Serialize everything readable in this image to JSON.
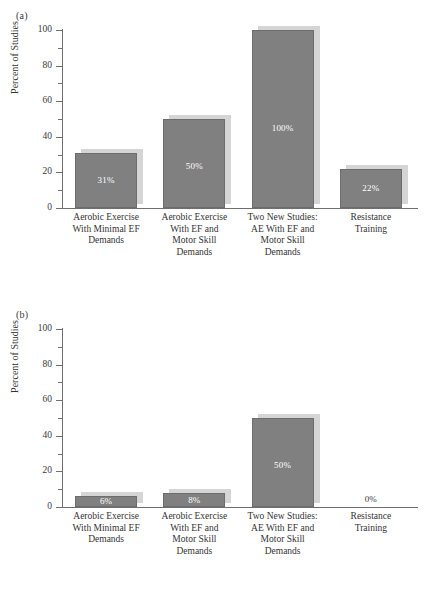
{
  "figure": {
    "panels": [
      {
        "key": "a",
        "label": "(a)",
        "ylabel": "Percent of Studies",
        "yticks": [
          0,
          20,
          40,
          60,
          80,
          100
        ],
        "categories": [
          [
            "Aerobic Exercise",
            "With Minimal EF",
            "Demands"
          ],
          [
            "Aerobic Exercise",
            "With EF and",
            "Motor Skill",
            "Demands"
          ],
          [
            "Two New Studies:",
            "AE With EF and",
            "Motor Skill",
            "Demands"
          ],
          [
            "Resistance",
            "Training"
          ]
        ],
        "values": [
          31,
          50,
          100,
          22
        ],
        "value_labels": [
          "31%",
          "50%",
          "100%",
          "22%"
        ]
      },
      {
        "key": "b",
        "label": "(b)",
        "ylabel": "Percent of Studies",
        "yticks": [
          0,
          20,
          40,
          60,
          80,
          100
        ],
        "categories": [
          [
            "Aerobic Exercise",
            "With Minimal EF",
            "Demands"
          ],
          [
            "Aerobic Exercise",
            "With EF and",
            "Motor Skill",
            "Demands"
          ],
          [
            "Two New Studies:",
            "AE With EF and",
            "Motor Skill",
            "Demands"
          ],
          [
            "Resistance",
            "Training"
          ]
        ],
        "values": [
          6,
          8,
          50,
          0
        ],
        "value_labels": [
          "6%",
          "8%",
          "50%",
          "0%"
        ]
      }
    ]
  },
  "chart_data": [
    {
      "type": "bar",
      "panel": "(a)",
      "title": "",
      "xlabel": "",
      "ylabel": "Percent of Studies",
      "ylim": [
        0,
        100
      ],
      "yticks": [
        0,
        20,
        40,
        60,
        80,
        100
      ],
      "minor_yticks": [
        10,
        30,
        50,
        70,
        90
      ],
      "grid": false,
      "legend": "none",
      "categories": [
        "Aerobic Exercise With Minimal EF Demands",
        "Aerobic Exercise With EF and Motor Skill Demands",
        "Two New Studies: AE With EF and Motor Skill Demands",
        "Resistance Training"
      ],
      "values": [
        31,
        50,
        100,
        22
      ],
      "data_labels": [
        "31%",
        "50%",
        "100%",
        "22%"
      ],
      "bar_color": "#808080",
      "shadow_color": "#d5d5d5"
    },
    {
      "type": "bar",
      "panel": "(b)",
      "title": "",
      "xlabel": "",
      "ylabel": "Percent of Studies",
      "ylim": [
        0,
        100
      ],
      "yticks": [
        0,
        20,
        40,
        60,
        80,
        100
      ],
      "minor_yticks": [
        10,
        30,
        50,
        70,
        90
      ],
      "grid": false,
      "legend": "none",
      "categories": [
        "Aerobic Exercise With Minimal EF Demands",
        "Aerobic Exercise With EF and Motor Skill Demands",
        "Two New Studies: AE With EF and Motor Skill Demands",
        "Resistance Training"
      ],
      "values": [
        6,
        8,
        50,
        0
      ],
      "data_labels": [
        "6%",
        "8%",
        "50%",
        "0%"
      ],
      "bar_color": "#808080",
      "shadow_color": "#d5d5d5"
    }
  ]
}
